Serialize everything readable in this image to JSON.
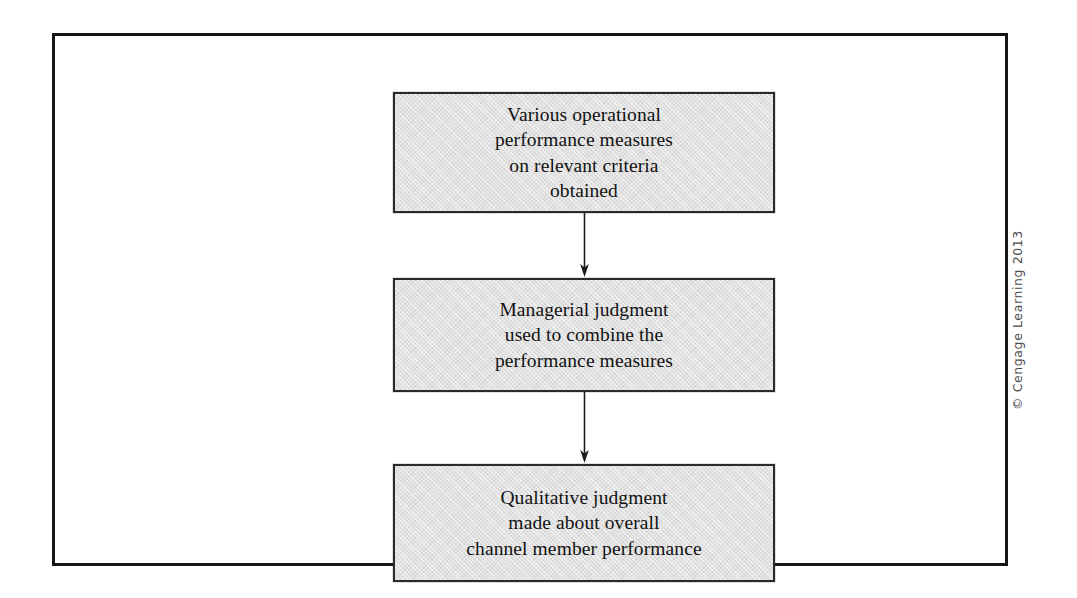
{
  "figure": {
    "type": "vertical-flowchart",
    "orientation": "top-to-bottom",
    "box_count": 3,
    "arrow_count": 2,
    "frame": {
      "border_color": "#151515",
      "background_color": "#ffffff"
    },
    "box_style": {
      "fill_color": "#e1e1e1",
      "border_color": "#2a2a2a",
      "text_color": "#121212"
    },
    "boxes": [
      {
        "id": "box-1",
        "text": "Various operational\nperformance measures\non relevant criteria\nobtained",
        "lines": [
          "Various operational",
          "performance measures",
          "on relevant criteria",
          "obtained"
        ]
      },
      {
        "id": "box-2",
        "text": "Managerial judgment\nused to combine the\nperformance measures",
        "lines": [
          "Managerial judgment",
          "used to combine the",
          "performance measures"
        ]
      },
      {
        "id": "box-3",
        "text": "Qualitative judgment\nmade about overall\nchannel member performance",
        "lines": [
          "Qualitative judgment",
          "made about overall",
          "channel member performance"
        ]
      }
    ],
    "arrows": [
      {
        "id": "arrow-1",
        "from": "box-1",
        "to": "box-2",
        "direction": "down"
      },
      {
        "id": "arrow-2",
        "from": "box-2",
        "to": "box-3",
        "direction": "down"
      }
    ]
  },
  "copyright": {
    "text": "© Cengage Learning 2013",
    "color": "#4a4a4a",
    "rotation": "vertical-bottom-to-top"
  }
}
